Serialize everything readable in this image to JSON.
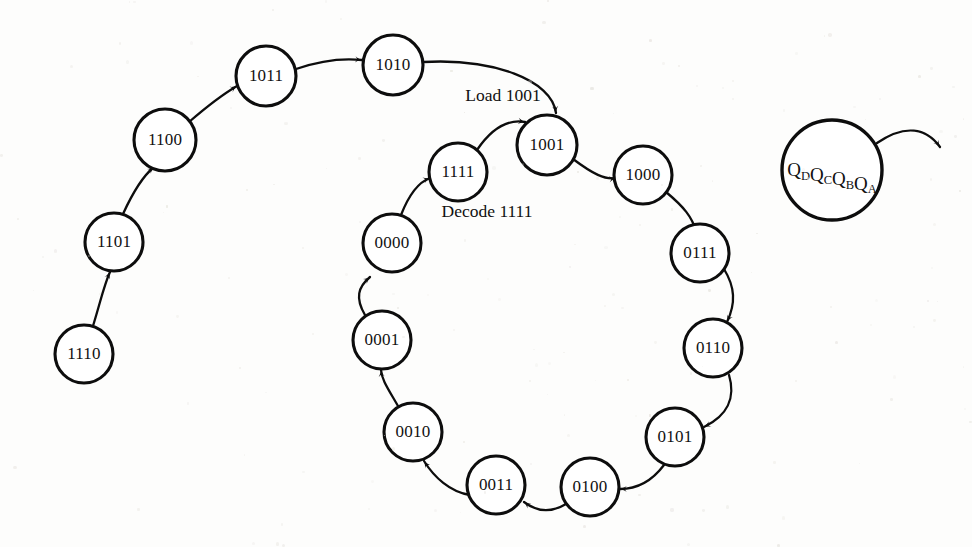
{
  "figure": {
    "background_color": "#fdfdfc",
    "stroke_color": "#0d0d0d",
    "width": 972,
    "height": 547
  },
  "states": [
    {
      "id": "s1110",
      "label": "1110",
      "cx": 84,
      "cy": 354,
      "r": 29
    },
    {
      "id": "s1101",
      "label": "1101",
      "cx": 114,
      "cy": 242,
      "r": 29
    },
    {
      "id": "s1100",
      "label": "1100",
      "cx": 165,
      "cy": 140,
      "r": 31
    },
    {
      "id": "s1011",
      "label": "1011",
      "cx": 266,
      "cy": 76,
      "r": 30
    },
    {
      "id": "s1010",
      "label": "1010",
      "cx": 393,
      "cy": 65,
      "r": 30
    },
    {
      "id": "s1001",
      "label": "1001",
      "cx": 547,
      "cy": 145,
      "r": 30
    },
    {
      "id": "s1000",
      "label": "1000",
      "cx": 643,
      "cy": 175,
      "r": 29
    },
    {
      "id": "s0111",
      "label": "0111",
      "cx": 700,
      "cy": 253,
      "r": 29
    },
    {
      "id": "s0110",
      "label": "0110",
      "cx": 713,
      "cy": 348,
      "r": 29
    },
    {
      "id": "s0101",
      "label": "0101",
      "cx": 675,
      "cy": 437,
      "r": 29
    },
    {
      "id": "s0100",
      "label": "0100",
      "cx": 590,
      "cy": 487,
      "r": 29
    },
    {
      "id": "s0011",
      "label": "0011",
      "cx": 496,
      "cy": 485,
      "r": 29
    },
    {
      "id": "s0010",
      "label": "0010",
      "cx": 413,
      "cy": 432,
      "r": 29
    },
    {
      "id": "s0001",
      "label": "0001",
      "cx": 382,
      "cy": 340,
      "r": 29
    },
    {
      "id": "s0000",
      "label": "0000",
      "cx": 392,
      "cy": 243,
      "r": 29
    },
    {
      "id": "s1111",
      "label": "1111",
      "cx": 458,
      "cy": 172,
      "r": 29
    }
  ],
  "transitions": [
    {
      "id": "t-1110-1101",
      "from": "1110",
      "to": "1101",
      "d": "M 93,326 C 101,300 104,285 110,272"
    },
    {
      "id": "t-1101-1100",
      "from": "1101",
      "to": "1100",
      "d": "M 123,214 C 133,192 143,176 154,167"
    },
    {
      "id": "t-1100-1011",
      "from": "1100",
      "to": "1011",
      "d": "M 189,122 C 211,103 225,93 237,86"
    },
    {
      "id": "t-1011-1010",
      "from": "1011",
      "to": "1010",
      "d": "M 296,69 C 322,60 343,58 362,60"
    },
    {
      "id": "t-1010-1001",
      "from": "1010",
      "to": "1001",
      "label": "Load 1001",
      "d": "M 423,62 C 493,58 552,80 556,113"
    },
    {
      "id": "t-1001-1000",
      "from": "1001",
      "to": "1000",
      "d": "M 573,159 C 593,174 605,180 616,178"
    },
    {
      "id": "t-1000-0111",
      "from": "1000",
      "to": "0111",
      "d": "M 666,192 C 684,207 692,217 696,231"
    },
    {
      "id": "t-0111-0110",
      "from": "0111",
      "to": "0110",
      "d": "M 724,269 C 735,287 736,303 727,322"
    },
    {
      "id": "t-0110-0101",
      "from": "0110",
      "to": "0101",
      "d": "M 729,375 C 736,398 727,416 704,427"
    },
    {
      "id": "t-0101-0100",
      "from": "0101",
      "to": "0100",
      "d": "M 664,465 C 652,481 636,489 620,489"
    },
    {
      "id": "t-0100-0011",
      "from": "0100",
      "to": "0011",
      "d": "M 566,504 C 551,513 537,512 524,502"
    },
    {
      "id": "t-0011-0010",
      "from": "0011",
      "to": "0010",
      "d": "M 470,495 C 450,492 434,477 424,461"
    },
    {
      "id": "t-0010-0001",
      "from": "0010",
      "to": "0001",
      "d": "M 398,406 C 387,387 382,380 381,370"
    },
    {
      "id": "t-0001-0000",
      "from": "0001",
      "to": "0000",
      "d": "M 365,315 C 355,298 358,287 370,277"
    },
    {
      "id": "t-0000-1111",
      "from": "0000",
      "to": "1111",
      "label": "Decode 1111",
      "d": "M 401,215 C 410,192 419,182 430,178"
    },
    {
      "id": "t-1111-1001",
      "from": "1111",
      "to": "1001",
      "d": "M 477,150 C 492,128 508,119 525,122"
    }
  ],
  "annotations": [
    {
      "id": "label-load",
      "text": "Load 1001",
      "x": 503,
      "y": 97
    },
    {
      "id": "label-decode",
      "text": "Decode 1111",
      "x": 487,
      "y": 213
    }
  ],
  "legend": {
    "id": "legend-node",
    "cx": 832,
    "cy": 170,
    "r": 50,
    "text": "QDQCQBQA",
    "parts": [
      {
        "base": "Q",
        "sub": "D"
      },
      {
        "base": "Q",
        "sub": "C"
      },
      {
        "base": "Q",
        "sub": "B"
      },
      {
        "base": "Q",
        "sub": "A"
      }
    ],
    "arrow": {
      "id": "legend-arrow",
      "d": "M 877,143 C 905,124 926,128 940,147"
    }
  }
}
